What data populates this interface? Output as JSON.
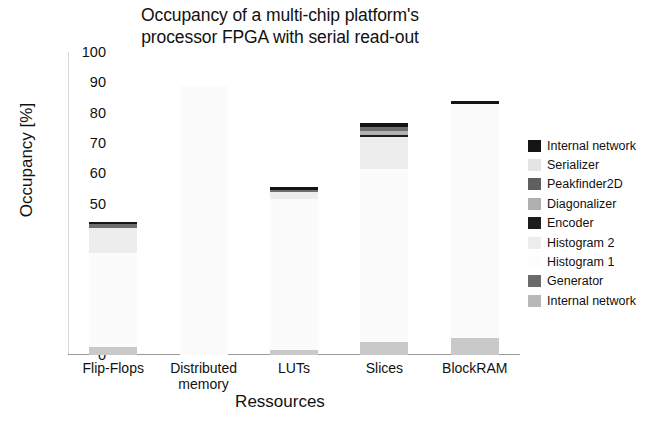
{
  "chart_data": {
    "type": "bar",
    "subtype": "stacked-bar",
    "title": "Occupancy of a multi-chip platform's\nprocessor FPGA with serial read-out",
    "xlabel": "Ressources",
    "ylabel": "Occupancy [%]",
    "ylim": [
      0,
      100
    ],
    "yticks": [
      0,
      10,
      20,
      30,
      40,
      50,
      60,
      70,
      80,
      90,
      100
    ],
    "grid": false,
    "legend_position": "right",
    "categories": [
      "Flip-Flops",
      "Distributed\nmemory",
      "LUTs",
      "Slices",
      "BlockRAM"
    ],
    "series": [
      {
        "name": "Internal network",
        "color": "#c9c9c9",
        "values": [
          2.6,
          0.0,
          1.6,
          4.3,
          5.6
        ]
      },
      {
        "name": "Generator",
        "color": "#7d7d7d",
        "values": [
          0.0,
          0.0,
          0.0,
          0.0,
          0.0
        ]
      },
      {
        "name": "Histogram 1",
        "color": "#fbfbfb",
        "values": [
          31.0,
          88.9,
          50.0,
          57.0,
          77.2
        ]
      },
      {
        "name": "Histogram 2",
        "color": "#ededed",
        "values": [
          8.2,
          0.0,
          2.2,
          10.5,
          0.0
        ]
      },
      {
        "name": "Encoder",
        "color": "#1c1c1c",
        "values": [
          0.0,
          0.0,
          0.0,
          0.8,
          0.0
        ]
      },
      {
        "name": "Diagonalizer",
        "color": "#b2b2b2",
        "values": [
          0.0,
          0.0,
          0.0,
          1.5,
          0.0
        ]
      },
      {
        "name": "Peakfinder2D",
        "color": "#6e6e6e",
        "values": [
          1.3,
          0.0,
          0.8,
          1.2,
          0.0
        ]
      },
      {
        "name": "Serializer",
        "color": "#e2e2e2",
        "values": [
          0.0,
          0.0,
          0.0,
          0.0,
          0.0
        ]
      },
      {
        "name": "Internal network top",
        "color": "#141414",
        "values": [
          0.9,
          0.0,
          0.9,
          1.4,
          1.1
        ]
      }
    ],
    "bar_totals": [
      44.0,
      88.9,
      55.5,
      76.7,
      83.9
    ]
  },
  "legend": {
    "items": [
      {
        "label": "Internal network",
        "color": "#141414"
      },
      {
        "label": "Serializer",
        "color": "#e4e4e4"
      },
      {
        "label": "Peakfinder2D",
        "color": "#5f5f5f"
      },
      {
        "label": "Diagonalizer",
        "color": "#b0b0b0"
      },
      {
        "label": "Encoder",
        "color": "#1c1c1c"
      },
      {
        "label": "Histogram 2",
        "color": "#ededed"
      },
      {
        "label": "Histogram 1",
        "color": "#fdfdfd"
      },
      {
        "label": "Generator",
        "color": "#6b6b6b"
      },
      {
        "label": "Internal network",
        "color": "#b8b8b8"
      }
    ]
  }
}
